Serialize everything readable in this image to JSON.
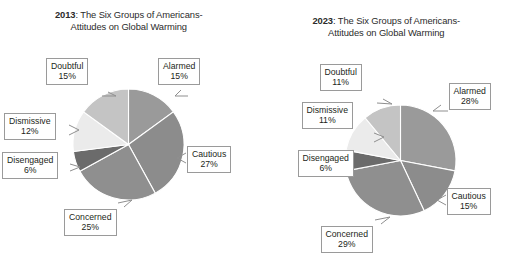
{
  "figure": {
    "background_color": "#ffffff",
    "panels": [
      {
        "id": "panel-2013",
        "title": {
          "year": "2013",
          "rest": ": The Six Groups of Americans-",
          "line2": "Attitudes on Global Warming"
        },
        "labels": {
          "doubtful": {
            "name": "Doubtful",
            "pct": "15%"
          },
          "alarmed": {
            "name": "Alarmed",
            "pct": "15%"
          },
          "dismissive": {
            "name": "Dismissive",
            "pct": "12%"
          },
          "cautious": {
            "name": "Cautious",
            "pct": "27%"
          },
          "disengaged": {
            "name": "Disengaged",
            "pct": "6%"
          },
          "concerned": {
            "name": "Concerned",
            "pct": "25%"
          }
        }
      },
      {
        "id": "panel-2023",
        "title": {
          "year": "2023",
          "rest": ": The Six Groups of Americans-",
          "line2": "Attitudes on Global Warming"
        },
        "labels": {
          "doubtful": {
            "name": "Doubtful",
            "pct": "11%"
          },
          "alarmed": {
            "name": "Alarmed",
            "pct": "28%"
          },
          "dismissive": {
            "name": "Dismissive",
            "pct": "11%"
          },
          "cautious": {
            "name": "Cautious",
            "pct": "15%"
          },
          "disengaged": {
            "name": "Disengaged",
            "pct": "6%"
          },
          "concerned": {
            "name": "Concerned",
            "pct": "29%"
          }
        }
      }
    ]
  },
  "chart_data": [
    {
      "type": "pie",
      "title": "2013: The Six Groups of Americans-Attitudes on Global Warming",
      "categories": [
        "Alarmed",
        "Cautious",
        "Concerned",
        "Disengaged",
        "Dismissive",
        "Doubtful"
      ],
      "values": [
        15,
        27,
        25,
        6,
        12,
        15
      ],
      "units": "percent",
      "start_angle_deg": 0,
      "direction": "clockwise",
      "colors": [
        "#9a9a9a",
        "#8c8c8c",
        "#8f8f8f",
        "#6b6b6b",
        "#ebebeb",
        "#c4c4c4"
      ],
      "labels_shown": [
        "Alarmed 15%",
        "Cautious 27%",
        "Concerned 25%",
        "Disengaged 6%",
        "Dismissive 12%",
        "Doubtful 15%"
      ],
      "legend": "none (callout labels)"
    },
    {
      "type": "pie",
      "title": "2023: The Six Groups of Americans-Attitudes on Global Warming",
      "categories": [
        "Alarmed",
        "Cautious",
        "Concerned",
        "Disengaged",
        "Dismissive",
        "Doubtful"
      ],
      "values": [
        28,
        15,
        29,
        6,
        11,
        11
      ],
      "units": "percent",
      "start_angle_deg": 0,
      "direction": "clockwise",
      "colors": [
        "#9a9a9a",
        "#8c8c8c",
        "#8f8f8f",
        "#6b6b6b",
        "#ebebeb",
        "#c4c4c4"
      ],
      "labels_shown": [
        "Alarmed 28%",
        "Cautious 15%",
        "Concerned 29%",
        "Disengaged 6%",
        "Dismissive 11%",
        "Doubtful 11%"
      ],
      "legend": "none (callout labels)"
    }
  ]
}
